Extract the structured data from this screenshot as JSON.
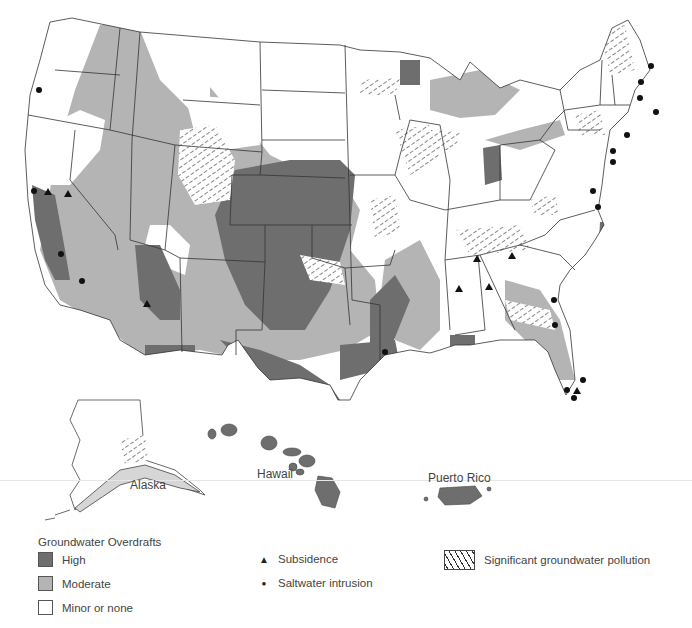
{
  "map": {
    "title": "Groundwater Overdrafts, Subsidence, Saltwater Intrusion and Pollution in the United States",
    "colors": {
      "high": "#6e6e6e",
      "moderate": "#b4b4b4",
      "minor": "#ffffff",
      "border": "#333333",
      "background": "#ffffff"
    },
    "region_labels": {
      "alaska": "Alaska",
      "hawaii": "Hawaii",
      "puerto_rico": "Puerto Rico"
    }
  },
  "legend": {
    "overdrafts_title": "Groundwater Overdrafts",
    "overdrafts": [
      {
        "label": "High",
        "color": "#6e6e6e"
      },
      {
        "label": "Moderate",
        "color": "#b4b4b4"
      },
      {
        "label": "Minor or none",
        "color": "#ffffff"
      }
    ],
    "symbols": [
      {
        "glyph": "▲",
        "label": "Subsidence"
      },
      {
        "glyph": "●",
        "label": "Saltwater intrusion"
      }
    ],
    "pollution": {
      "label": "Significant groundwater pollution"
    }
  }
}
